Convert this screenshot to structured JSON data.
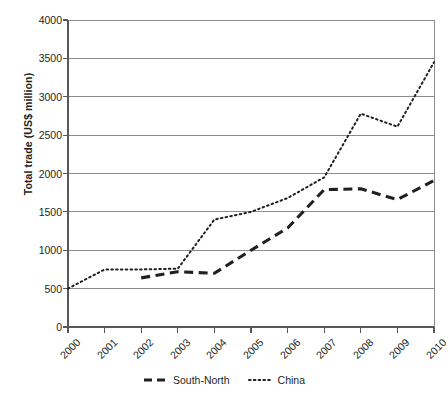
{
  "chart_data": {
    "type": "line",
    "title": "",
    "xlabel": "",
    "ylabel": "Total trade (US$ million)",
    "x": [
      "2000",
      "2001",
      "2002",
      "2003",
      "2004",
      "2005",
      "2006",
      "2007",
      "2008",
      "2009",
      "2010"
    ],
    "categories": [
      "2000",
      "2001",
      "2002",
      "2003",
      "2004",
      "2005",
      "2006",
      "2007",
      "2008",
      "2009",
      "2010"
    ],
    "ylim": [
      0,
      4000
    ],
    "yticks": [
      0,
      500,
      1000,
      1500,
      2000,
      2500,
      3000,
      3500,
      4000
    ],
    "ytick_labels": [
      "0",
      "500",
      "1000",
      "1500",
      "2000",
      "2500",
      "3000",
      "3500",
      "4000"
    ],
    "grid": "horizontal",
    "legend_position": "bottom-center",
    "series": [
      {
        "name": "South-North",
        "style": "dashed",
        "color": "#231f20",
        "values": [
          null,
          null,
          640,
          720,
          700,
          1000,
          1290,
          1790,
          1800,
          1660,
          1910
        ]
      },
      {
        "name": "China",
        "style": "dotted",
        "color": "#231f20",
        "values": [
          500,
          750,
          750,
          760,
          1400,
          1500,
          1680,
          1950,
          2780,
          2610,
          3450
        ]
      }
    ]
  },
  "axes": {
    "y_title": "Total trade (US$ million)"
  },
  "legend": {
    "items": [
      {
        "label": "South-North",
        "style": "dashed"
      },
      {
        "label": "China",
        "style": "dotted"
      }
    ]
  }
}
